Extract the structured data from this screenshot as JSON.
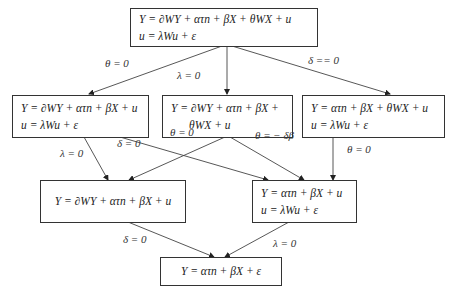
{
  "diagram": {
    "type": "model-nesting-tree",
    "nodes": [
      {
        "id": "top",
        "lines": [
          "Y = ∂WY + ατn + βX + θWX + u",
          "u = λWu + ε"
        ]
      },
      {
        "id": "r2_left",
        "lines": [
          "Y = ∂WY + ατn + βX + u",
          "u = λWu + ε"
        ]
      },
      {
        "id": "r2_mid",
        "lines": [
          "Y = ∂WY + ατn + βX +",
          "θWX + u"
        ]
      },
      {
        "id": "r2_right",
        "lines": [
          "Y = ατn + βX + θWX + u",
          "u = λWu + ε"
        ]
      },
      {
        "id": "r3_left",
        "lines": [
          "Y = ∂WY + ατn + βX + u"
        ]
      },
      {
        "id": "r3_right",
        "lines": [
          "Y = ατn + βX + u",
          "u = λWu + ε"
        ]
      },
      {
        "id": "bottom",
        "lines": [
          "Y = ατn + βX + ε"
        ]
      }
    ],
    "edges": [
      {
        "from": "top",
        "to": "r2_left",
        "label": "θ = 0"
      },
      {
        "from": "top",
        "to": "r2_mid",
        "label": "λ = 0"
      },
      {
        "from": "top",
        "to": "r2_right",
        "label": "δ == 0"
      },
      {
        "from": "r2_left",
        "to": "r3_left",
        "label": "λ = 0"
      },
      {
        "from": "r2_left",
        "to": "r3_right",
        "label": "δ = 0"
      },
      {
        "from": "r2_mid",
        "to": "r3_left",
        "label": "θ = 0"
      },
      {
        "from": "r2_mid",
        "to": "r3_right",
        "label": "θ = − δβ"
      },
      {
        "from": "r2_right",
        "to": "r3_right",
        "label": "θ = 0"
      },
      {
        "from": "r3_left",
        "to": "bottom",
        "label": "δ = 0"
      },
      {
        "from": "r3_right",
        "to": "bottom",
        "label": "λ = 0"
      }
    ]
  },
  "colors": {
    "line": "#333333",
    "text": "#222222",
    "background": "#ffffff"
  }
}
